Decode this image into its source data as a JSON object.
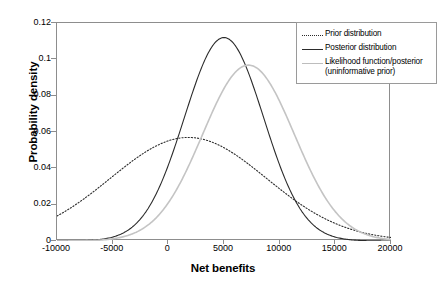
{
  "chart_data": {
    "type": "line",
    "title": "",
    "xlabel": "Net benefits",
    "ylabel": "Probability density",
    "xlim": [
      -10000,
      20000
    ],
    "ylim": [
      0,
      0.12
    ],
    "xticks": [
      "-10000",
      "-5000",
      "0",
      "5000",
      "10000",
      "15000",
      "20000"
    ],
    "xtick_values": [
      -10000,
      -5000,
      0,
      5000,
      10000,
      15000,
      20000
    ],
    "yticks": [
      "0",
      "0.02",
      "0.04",
      "0.06",
      "0.08",
      "0.1",
      "0.12"
    ],
    "ytick_values": [
      0,
      0.02,
      0.04,
      0.06,
      0.08,
      0.1,
      0.12
    ],
    "grid": false,
    "legend_position": "top-right",
    "series": [
      {
        "name": "Prior distribution",
        "style": "dotted",
        "color": "#2b2b2b",
        "distribution": "normal",
        "mean": 1800,
        "sd": 7000,
        "peak_value": 0.057,
        "x": [
          -10000,
          -8000,
          -6000,
          -4000,
          -2000,
          0,
          2000,
          4000,
          6000,
          8000,
          10000,
          12000,
          14000,
          16000,
          18000,
          20000
        ],
        "y": [
          0.0141,
          0.0213,
          0.0298,
          0.0386,
          0.0466,
          0.0527,
          0.0562,
          0.0563,
          0.0532,
          0.0474,
          0.0397,
          0.0313,
          0.0232,
          0.0162,
          0.0106,
          0.0065
        ]
      },
      {
        "name": "Posterior distribution",
        "style": "solid",
        "color": "#2b2b2b",
        "distribution": "normal",
        "mean": 5000,
        "sd": 3560,
        "peak_value": 0.112,
        "x": [
          -10000,
          -8000,
          -6000,
          -4000,
          -2000,
          0,
          2000,
          4000,
          6000,
          8000,
          10000,
          12000,
          14000,
          16000,
          18000,
          20000
        ],
        "y": [
          3e-05,
          0.00019,
          0.0009,
          0.0033,
          0.0095,
          0.0221,
          0.0417,
          0.0641,
          0.0802,
          0.0817,
          0.0677,
          0.0456,
          0.025,
          0.0111,
          0.004,
          0.0012
        ]
      },
      {
        "name": "Likelihood function/posterior\n(uninformative prior)",
        "style": "solid",
        "color": "#c4c4c4",
        "distribution": "normal",
        "mean": 7200,
        "sd": 4120,
        "peak_value": 0.0968,
        "x": [
          -10000,
          -8000,
          -6000,
          -4000,
          -2000,
          0,
          2000,
          4000,
          6000,
          8000,
          10000,
          12000,
          14000,
          16000,
          18000,
          20000
        ],
        "y": [
          2e-05,
          0.00011,
          0.0005,
          0.0017,
          0.0049,
          0.0115,
          0.0225,
          0.0371,
          0.0523,
          0.0633,
          0.0663,
          0.0599,
          0.0468,
          0.0316,
          0.0185,
          0.0094
        ]
      }
    ]
  },
  "legend": {
    "items": [
      {
        "label": "Prior distribution"
      },
      {
        "label": "Posterior distribution"
      },
      {
        "label": "Likelihood function/posterior\n(uninformative prior)"
      }
    ]
  }
}
